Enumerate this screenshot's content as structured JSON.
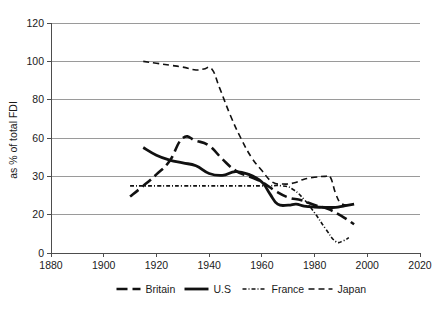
{
  "chart_data": {
    "type": "line",
    "title": "",
    "subtitle": "",
    "xlabel": "",
    "ylabel": "as % of total FDI",
    "xlim": [
      1880,
      2020
    ],
    "ylim": [
      0,
      120
    ],
    "grid": true,
    "legend_position": "bottom",
    "x_ticks": [
      "1880",
      "1900",
      "1920",
      "1940",
      "1960",
      "1980",
      "2000",
      "2020"
    ],
    "x_tick_values": [
      1880,
      1900,
      1920,
      1940,
      1960,
      1980,
      2000,
      2020
    ],
    "y_ticks": [
      "0",
      "20",
      "30",
      "60",
      "80",
      "100",
      "120"
    ],
    "y_tick_values": [
      0,
      20,
      30,
      60,
      80,
      100,
      120
    ],
    "y_tick_positions": [
      0,
      20,
      40,
      60,
      80,
      100,
      120
    ],
    "series": [
      {
        "name": "Britain",
        "style": "long-dash",
        "dasharray": "11,5",
        "width": 2.6,
        "color": "#111111",
        "points": [
          [
            1910,
            29.5
          ],
          [
            1915,
            35.0
          ],
          [
            1920,
            41.0
          ],
          [
            1925,
            48.0
          ],
          [
            1930,
            60.0
          ],
          [
            1935,
            58.5
          ],
          [
            1940,
            56.0
          ],
          [
            1945,
            49.0
          ],
          [
            1950,
            43.0
          ],
          [
            1955,
            40.0
          ],
          [
            1960,
            37.0
          ],
          [
            1965,
            32.5
          ],
          [
            1970,
            29.0
          ],
          [
            1975,
            27.5
          ],
          [
            1980,
            25.0
          ],
          [
            1985,
            23.0
          ],
          [
            1990,
            19.5
          ],
          [
            1995,
            15.0
          ]
        ]
      },
      {
        "name": "U.S",
        "style": "solid",
        "dasharray": "none",
        "width": 2.8,
        "color": "#111111",
        "points": [
          [
            1915,
            55.0
          ],
          [
            1920,
            51.0
          ],
          [
            1925,
            48.5
          ],
          [
            1930,
            47.0
          ],
          [
            1935,
            45.5
          ],
          [
            1940,
            41.5
          ],
          [
            1945,
            40.5
          ],
          [
            1950,
            42.5
          ],
          [
            1955,
            41.0
          ],
          [
            1960,
            37.0
          ],
          [
            1963,
            31.0
          ],
          [
            1966,
            25.5
          ],
          [
            1970,
            25.0
          ],
          [
            1973,
            25.5
          ],
          [
            1976,
            24.5
          ],
          [
            1980,
            24.0
          ],
          [
            1985,
            23.8
          ],
          [
            1988,
            23.8
          ],
          [
            1991,
            24.5
          ],
          [
            1995,
            25.5
          ]
        ]
      },
      {
        "name": "France",
        "style": "dash-dot-fine",
        "dasharray": "4,2,1,2",
        "width": 1.6,
        "color": "#111111",
        "points": [
          [
            1910,
            35.0
          ],
          [
            1920,
            35.0
          ],
          [
            1930,
            35.0
          ],
          [
            1940,
            35.0
          ],
          [
            1950,
            35.0
          ],
          [
            1960,
            35.0
          ],
          [
            1968,
            35.0
          ],
          [
            1972,
            33.0
          ],
          [
            1976,
            28.0
          ],
          [
            1980,
            21.0
          ],
          [
            1984,
            13.0
          ],
          [
            1988,
            6.0
          ],
          [
            1991,
            6.5
          ],
          [
            1993,
            8.0
          ]
        ]
      },
      {
        "name": "Japan",
        "style": "dash",
        "dasharray": "6,4",
        "width": 1.6,
        "color": "#111111",
        "points": [
          [
            1915,
            100.0
          ],
          [
            1920,
            99.0
          ],
          [
            1925,
            98.0
          ],
          [
            1930,
            97.0
          ],
          [
            1935,
            95.5
          ],
          [
            1938,
            96.0
          ],
          [
            1941,
            96.0
          ],
          [
            1944,
            86.0
          ],
          [
            1948,
            72.0
          ],
          [
            1952,
            60.0
          ],
          [
            1956,
            50.0
          ],
          [
            1960,
            43.0
          ],
          [
            1964,
            37.0
          ],
          [
            1968,
            36.0
          ],
          [
            1972,
            36.5
          ],
          [
            1976,
            38.5
          ],
          [
            1980,
            39.5
          ],
          [
            1984,
            40.0
          ],
          [
            1986,
            39.5
          ],
          [
            1988,
            31.0
          ],
          [
            1990,
            26.0
          ],
          [
            1993,
            25.0
          ]
        ]
      }
    ]
  },
  "legend": {
    "items": [
      {
        "label": "Britain",
        "swatch": "long-dash"
      },
      {
        "label": "U.S",
        "swatch": "solid"
      },
      {
        "label": "France",
        "swatch": "dash-dot-fine"
      },
      {
        "label": "Japan",
        "swatch": "dash"
      }
    ]
  }
}
